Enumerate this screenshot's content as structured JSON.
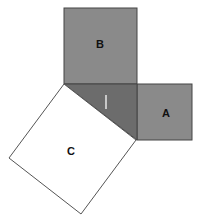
{
  "diagram": {
    "type": "pythagorean-squares",
    "labels": {
      "square_a": "A",
      "square_b": "B",
      "square_c": "C"
    },
    "colors": {
      "square_fill": "#8a8a8a",
      "triangle_fill": "#6a6a6a",
      "square_c_fill": "#ffffff",
      "stroke": "#444444",
      "tick_mark": "#c8c8c8"
    }
  }
}
